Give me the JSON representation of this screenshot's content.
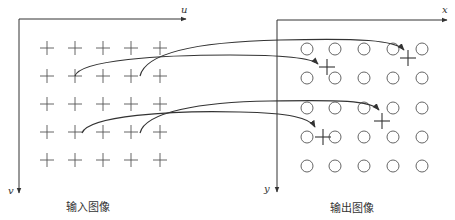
{
  "input_panel": {
    "caption": "输入图像",
    "axis_h_label": "u",
    "axis_v_label": "v",
    "grid": {
      "columns_x": [
        47,
        75,
        103,
        131,
        160
      ],
      "rows_y": [
        48,
        76,
        104,
        132,
        160
      ],
      "marker": "cross"
    }
  },
  "output_panel": {
    "caption": "输出图像",
    "axis_h_label": "x",
    "axis_v_label": "y",
    "grid": {
      "columns_x": [
        307,
        335,
        364,
        393,
        422
      ],
      "rows_y": [
        49,
        78,
        108,
        137,
        166
      ],
      "marker": "circle"
    },
    "mapped_points": [
      {
        "x": 327,
        "y": 67
      },
      {
        "x": 408,
        "y": 58
      },
      {
        "x": 323,
        "y": 137
      },
      {
        "x": 382,
        "y": 121
      }
    ]
  },
  "mappings": [
    {
      "from": [
        75,
        76
      ],
      "to": [
        318,
        67
      ],
      "path": "M75,76 C80,60 160,55 230,55 C280,55 312,58 318,64"
    },
    {
      "from": [
        140,
        76
      ],
      "to": [
        404,
        50
      ],
      "path": "M140,76 C145,55 190,42 280,40 C360,38 395,40 404,50"
    },
    {
      "from": [
        82,
        133
      ],
      "to": [
        315,
        130
      ],
      "path": "M82,133 C88,116 170,110 240,112 C290,113 310,118 315,127"
    },
    {
      "from": [
        140,
        133
      ],
      "to": [
        379,
        112
      ],
      "path": "M140,133 C145,112 200,102 270,101 C340,100 370,100 379,110"
    }
  ],
  "colors": {
    "ink": "#333333",
    "markers": "#555555",
    "background": "#ffffff"
  }
}
